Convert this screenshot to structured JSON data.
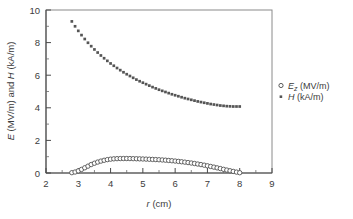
{
  "chart_data": {
    "type": "scatter",
    "title": "",
    "xlabel": "r (cm)",
    "xlabel_italic_part": "r",
    "xlabel_rest": " (cm)",
    "ylabel": "E (MV/m) and H (kA/m)",
    "ylabel_parts": [
      "E",
      " (MV/m) and ",
      "H",
      " (kA/m)"
    ],
    "xlim": [
      2,
      9
    ],
    "ylim": [
      0,
      10
    ],
    "xticks": [
      2,
      3,
      4,
      5,
      6,
      7,
      8,
      9
    ],
    "xtick_labels": [
      "2",
      "3",
      "4",
      "5",
      "6",
      "7",
      "8",
      "9"
    ],
    "yticks": [
      0,
      2,
      4,
      6,
      8,
      10
    ],
    "ytick_labels": [
      "0",
      "2",
      "4",
      "6",
      "8",
      "10"
    ],
    "x_minor_ticks": [
      2.5,
      3.5,
      4.5,
      5.5,
      6.5,
      7.5,
      8.5
    ],
    "y_minor_ticks": [
      1,
      3,
      5,
      7,
      9
    ],
    "grid": false,
    "legend_position": "right-outside",
    "frame": true,
    "series": [
      {
        "name": "E_z (MV/m)",
        "label_main": "E",
        "label_sub": "z",
        "label_unit": " (MV/m)",
        "marker": "open-circle",
        "color": "#4a4a4a",
        "x": [
          2.8,
          2.9,
          3.0,
          3.1,
          3.2,
          3.3,
          3.4,
          3.5,
          3.6,
          3.7,
          3.8,
          3.9,
          4.0,
          4.1,
          4.2,
          4.3,
          4.4,
          4.5,
          4.6,
          4.7,
          4.8,
          4.9,
          5.0,
          5.1,
          5.2,
          5.3,
          5.4,
          5.5,
          5.6,
          5.7,
          5.8,
          5.9,
          6.0,
          6.1,
          6.2,
          6.3,
          6.4,
          6.5,
          6.6,
          6.7,
          6.8,
          6.9,
          7.0,
          7.1,
          7.2,
          7.3,
          7.4,
          7.5,
          7.6,
          7.7,
          7.8,
          7.9,
          8.0
        ],
        "y": [
          0.02,
          0.06,
          0.13,
          0.22,
          0.32,
          0.42,
          0.52,
          0.6,
          0.67,
          0.73,
          0.78,
          0.82,
          0.85,
          0.87,
          0.88,
          0.885,
          0.888,
          0.888,
          0.885,
          0.88,
          0.874,
          0.868,
          0.86,
          0.852,
          0.843,
          0.834,
          0.824,
          0.813,
          0.8,
          0.786,
          0.77,
          0.752,
          0.733,
          0.712,
          0.69,
          0.666,
          0.64,
          0.612,
          0.582,
          0.55,
          0.516,
          0.48,
          0.442,
          0.402,
          0.36,
          0.316,
          0.272,
          0.226,
          0.181,
          0.138,
          0.097,
          0.055,
          0.018
        ]
      },
      {
        "name": "H (kA/m)",
        "label_main": "H",
        "label_unit": " (kA/m)",
        "marker": "filled-dot",
        "color": "#555555",
        "x": [
          2.8,
          2.9,
          3.0,
          3.1,
          3.2,
          3.3,
          3.4,
          3.5,
          3.6,
          3.7,
          3.8,
          3.9,
          4.0,
          4.1,
          4.2,
          4.3,
          4.4,
          4.5,
          4.6,
          4.7,
          4.8,
          4.9,
          5.0,
          5.1,
          5.2,
          5.3,
          5.4,
          5.5,
          5.6,
          5.7,
          5.8,
          5.9,
          6.0,
          6.1,
          6.2,
          6.3,
          6.4,
          6.5,
          6.6,
          6.7,
          6.8,
          6.9,
          7.0,
          7.1,
          7.2,
          7.3,
          7.4,
          7.5,
          7.6,
          7.7,
          7.8,
          7.9,
          8.0
        ],
        "y": [
          9.3,
          9.0,
          8.72,
          8.46,
          8.22,
          7.99,
          7.78,
          7.58,
          7.39,
          7.21,
          7.04,
          6.88,
          6.72,
          6.58,
          6.44,
          6.31,
          6.18,
          6.06,
          5.95,
          5.84,
          5.73,
          5.63,
          5.54,
          5.45,
          5.36,
          5.27,
          5.19,
          5.11,
          5.04,
          4.97,
          4.9,
          4.83,
          4.77,
          4.71,
          4.65,
          4.59,
          4.54,
          4.49,
          4.44,
          4.39,
          4.35,
          4.31,
          4.27,
          4.23,
          4.2,
          4.17,
          4.14,
          4.12,
          4.1,
          4.09,
          4.08,
          4.08,
          4.08
        ]
      }
    ]
  },
  "colors": {
    "axis": "#5a5a5a",
    "frame": "#8a8a8a",
    "text": "#3c3c3c",
    "ez_marker": "#4a4a4a",
    "h_marker": "#555555",
    "background": "#ffffff"
  }
}
